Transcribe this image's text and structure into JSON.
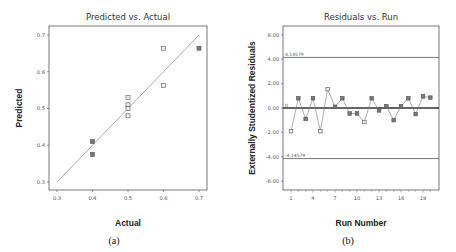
{
  "chart_data": [
    {
      "type": "scatter",
      "panel_caption": "(a)",
      "title": "Predicted vs. Actual",
      "xlabel": "Actual",
      "ylabel": "Predicted",
      "xlim": [
        0.3,
        0.7
      ],
      "ylim": [
        0.3,
        0.7
      ],
      "xticks": [
        "0.3",
        "0.4",
        "0.5",
        "0.6",
        "0.7"
      ],
      "yticks": [
        "0.3",
        "0.4",
        "0.5",
        "0.6",
        "0.7"
      ],
      "grid": false,
      "reference_line": {
        "from": [
          0.3,
          0.3
        ],
        "to": [
          0.7,
          0.7
        ]
      },
      "points": [
        {
          "x": 0.4,
          "y": 0.41
        },
        {
          "x": 0.4,
          "y": 0.375
        },
        {
          "x": 0.5,
          "y": 0.53
        },
        {
          "x": 0.5,
          "y": 0.51
        },
        {
          "x": 0.5,
          "y": 0.5
        },
        {
          "x": 0.5,
          "y": 0.48
        },
        {
          "x": 0.6,
          "y": 0.664
        },
        {
          "x": 0.6,
          "y": 0.563
        },
        {
          "x": 0.7,
          "y": 0.664
        }
      ]
    },
    {
      "type": "line",
      "panel_caption": "(b)",
      "title": "Residuals vs. Run",
      "xlabel": "Run Number",
      "ylabel": "Externally Studentized Residuals",
      "xlim": [
        0,
        21
      ],
      "ylim": [
        -6.0,
        6.0
      ],
      "xticks": [
        "1",
        "4",
        "7",
        "10",
        "13",
        "16",
        "19"
      ],
      "yticks": [
        "6.00",
        "4.00",
        "2.00",
        "0.00",
        "-2.00",
        "-4.00",
        "-6.00"
      ],
      "grid": false,
      "limit_lines": [
        {
          "label": "4.14579",
          "value": 4.14579
        },
        {
          "label": "0",
          "value": 0
        },
        {
          "label": "-4.14579",
          "value": -4.14579
        }
      ],
      "x": [
        1,
        2,
        3,
        4,
        5,
        6,
        7,
        8,
        9,
        10,
        11,
        12,
        13,
        14,
        15,
        16,
        17,
        18,
        19,
        20
      ],
      "values": [
        -1.9,
        0.8,
        -0.9,
        0.8,
        -1.9,
        1.55,
        0.1,
        0.8,
        -0.45,
        -0.45,
        -1.15,
        0.8,
        -0.2,
        0.15,
        -1.0,
        0.15,
        0.8,
        -0.5,
        0.95,
        0.85
      ]
    }
  ]
}
